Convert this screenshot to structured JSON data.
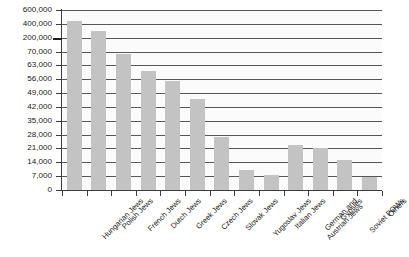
{
  "chart_data": {
    "type": "bar",
    "title": "",
    "subtitle": "",
    "xlabel": "",
    "ylabel": "",
    "grid": true,
    "legend": false,
    "axis_note": "broken y-axis: linear 0-70,000 in 7,000 steps, then compressed 200,000 / 400,000 / 600,000",
    "ylim": [
      0,
      600000
    ],
    "ytick_labels": [
      "600,000",
      "400,000",
      "200,000",
      "70,000",
      "63,000",
      "56,000",
      "49,000",
      "42,000",
      "35,000",
      "28,000",
      "21,000",
      "14,000",
      "7,000",
      "0"
    ],
    "ytick_values": [
      600000,
      400000,
      200000,
      70000,
      63000,
      56000,
      49000,
      42000,
      35000,
      28000,
      21000,
      14000,
      7000,
      0
    ],
    "categories": [
      "Hungarian Jews",
      "Polish Jews",
      "French Jews",
      "Dutch Jews",
      "Greek Jews",
      "Czech Jews",
      "Slovak Jews",
      "Yugoslav Jews",
      "Italian Jews",
      "German and Austrian Jews",
      "Gypsies",
      "Soviet POWs",
      "Others"
    ],
    "category_lines": [
      [
        "Hungarian Jews"
      ],
      [
        "Polish Jews"
      ],
      [
        "French Jews"
      ],
      [
        "Dutch Jews"
      ],
      [
        "Greek Jews"
      ],
      [
        "Czech Jews"
      ],
      [
        "Slovak Jews"
      ],
      [
        "Yugoslav Jews"
      ],
      [
        "Italian Jews"
      ],
      [
        "German and",
        "Austrian Jews"
      ],
      [
        "Gypsies"
      ],
      [
        "Soviet POWs"
      ],
      [
        "Others"
      ]
    ],
    "values": [
      438000,
      300000,
      69000,
      60000,
      55000,
      46000,
      27000,
      10000,
      7500,
      23000,
      21000,
      15000,
      6500
    ],
    "bar_color": "#c3c3c3",
    "gridline_color": "#55565a",
    "axis_color": "#3b3c3f",
    "plot_background": "#fbfbfb"
  }
}
